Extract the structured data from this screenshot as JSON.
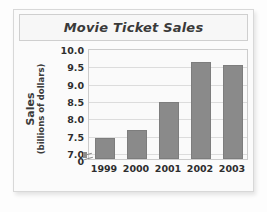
{
  "figure": {
    "title": "Movie Ticket Sales"
  },
  "chart_data": {
    "type": "bar",
    "title": "Movie Ticket Sales",
    "xlabel": "",
    "ylabel": "Sales (billions of dollars)",
    "ylabel_lines": [
      "Sales",
      "(billions of dollars)"
    ],
    "categories": [
      "1999",
      "2000",
      "2001",
      "2002",
      "2003"
    ],
    "values": [
      7.4,
      7.65,
      8.45,
      9.6,
      9.5
    ],
    "ylim": [
      6.8,
      10.0
    ],
    "yticks": [
      "0",
      "7.0",
      "7.5",
      "8.0",
      "8.5",
      "9.0",
      "9.5",
      "10.0"
    ],
    "ytick_values": [
      6.8,
      7.0,
      7.5,
      8.0,
      8.5,
      9.0,
      9.5,
      10.0
    ],
    "axis_break": true,
    "grid": true,
    "legend": "none",
    "bar_color": "#8a8a8a",
    "bar_edge_color": "#7d7d7d",
    "grid_color": "#dcdcdc",
    "plot_background": "#fafafa",
    "text_color": "#2e2e2e"
  }
}
